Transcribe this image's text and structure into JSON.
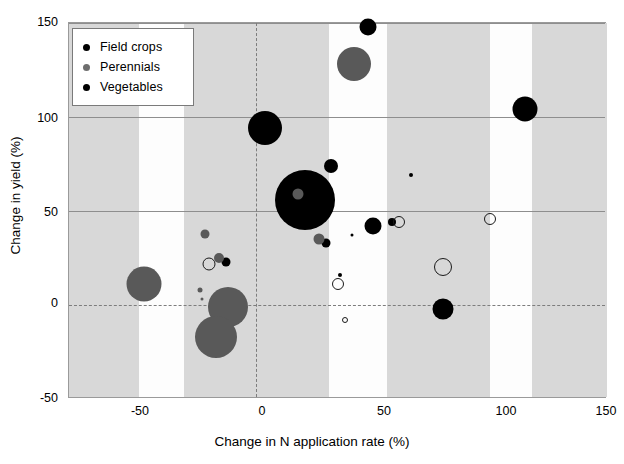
{
  "chart_data": {
    "type": "scatter",
    "title": "",
    "xlabel": "Change in N application rate (%)",
    "ylabel": "Change in yield (%)",
    "xlim": [
      -80,
      150
    ],
    "ylim": [
      -50,
      150
    ],
    "xticks": [
      -50,
      0,
      50,
      100,
      150
    ],
    "yticks": [
      -50,
      0,
      50,
      100,
      150
    ],
    "grid": "horizontal gridlines at y=50,100,150; dashed reference lines at x=0 and y=0",
    "legend_position": "top-left inside plot",
    "bubble_note": "marker area encodes a third magnitude variable",
    "series": [
      {
        "name": "Field crops",
        "color": "#000000",
        "style": "filled",
        "points": [
          {
            "x": 4,
            "y": 94,
            "size": 34
          },
          {
            "x": 21,
            "y": 56,
            "size": 60
          },
          {
            "x": 32,
            "y": 74,
            "size": 14
          },
          {
            "x": 48,
            "y": 148,
            "size": 17
          },
          {
            "x": 115,
            "y": 104,
            "size": 25
          },
          {
            "x": 50,
            "y": 42,
            "size": 17
          },
          {
            "x": 58,
            "y": 44,
            "size": 8
          },
          {
            "x": 30,
            "y": 33,
            "size": 9
          },
          {
            "x": 80,
            "y": -2,
            "size": 21
          },
          {
            "x": -13,
            "y": 23,
            "size": 9
          },
          {
            "x": 66,
            "y": 69,
            "size": 4
          },
          {
            "x": 36,
            "y": 16,
            "size": 4
          },
          {
            "x": 41,
            "y": 37,
            "size": 3
          }
        ]
      },
      {
        "name": "Perennials",
        "color": "#595959",
        "style": "filled",
        "points": [
          {
            "x": 42,
            "y": 128,
            "size": 34
          },
          {
            "x": 18,
            "y": 59,
            "size": 11
          },
          {
            "x": -48,
            "y": 11,
            "size": 35
          },
          {
            "x": -12,
            "y": -1,
            "size": 40
          },
          {
            "x": -17,
            "y": -17,
            "size": 42
          },
          {
            "x": 27,
            "y": 35,
            "size": 11
          },
          {
            "x": -22,
            "y": 38,
            "size": 9
          },
          {
            "x": -16,
            "y": 25,
            "size": 10
          },
          {
            "x": -24,
            "y": 8,
            "size": 5
          },
          {
            "x": -23,
            "y": 3,
            "size": 3
          }
        ]
      },
      {
        "name": "Vegetables",
        "color": "#000000",
        "style": "open",
        "points": [
          {
            "x": 61,
            "y": 44,
            "size": 12
          },
          {
            "x": 100,
            "y": 46,
            "size": 12
          },
          {
            "x": 80,
            "y": 20,
            "size": 18
          },
          {
            "x": 35,
            "y": 11,
            "size": 12
          },
          {
            "x": -20,
            "y": 22,
            "size": 13
          },
          {
            "x": 38,
            "y": -8,
            "size": 6
          }
        ]
      }
    ],
    "shaded_bands": [
      {
        "from": -80,
        "to": -50
      },
      {
        "from": -31,
        "to": 0
      },
      {
        "from": 0,
        "to": 31
      },
      {
        "from": 56,
        "to": 100
      },
      {
        "from": 118,
        "to": 150
      }
    ]
  },
  "legend": {
    "items": [
      {
        "label": "Field crops",
        "marker": "filled-black-dot-icon"
      },
      {
        "label": "Perennials",
        "marker": "filled-gray-dot-icon"
      },
      {
        "label": "Vegetables",
        "marker": "filled-black-dot-icon"
      }
    ]
  },
  "colors": {
    "field_crops": "#000000",
    "perennials": "#595959",
    "vegetables_outline": "#1a1a1a",
    "band": "#d8d8d8",
    "gridline": "#8e8e8e",
    "reference_line": "#7d7d7d"
  }
}
